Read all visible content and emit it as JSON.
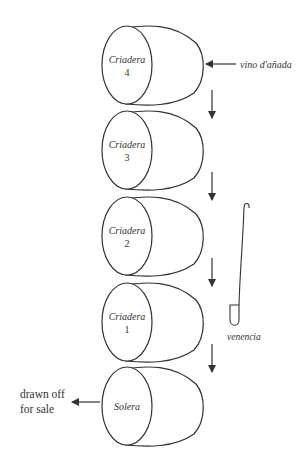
{
  "barrels": [
    {
      "name": "Criadera",
      "number": "4"
    },
    {
      "name": "Criadera",
      "number": "3"
    },
    {
      "name": "Criadera",
      "number": "2"
    },
    {
      "name": "Criadera",
      "number": "1"
    },
    {
      "name": "Solera",
      "number": ""
    }
  ],
  "input_label": "vino d'añada",
  "output_label_line1": "drawn off",
  "output_label_line2": "for sale",
  "tool_label": "venencia",
  "colors": {
    "line": "#333333",
    "background": "#ffffff"
  }
}
